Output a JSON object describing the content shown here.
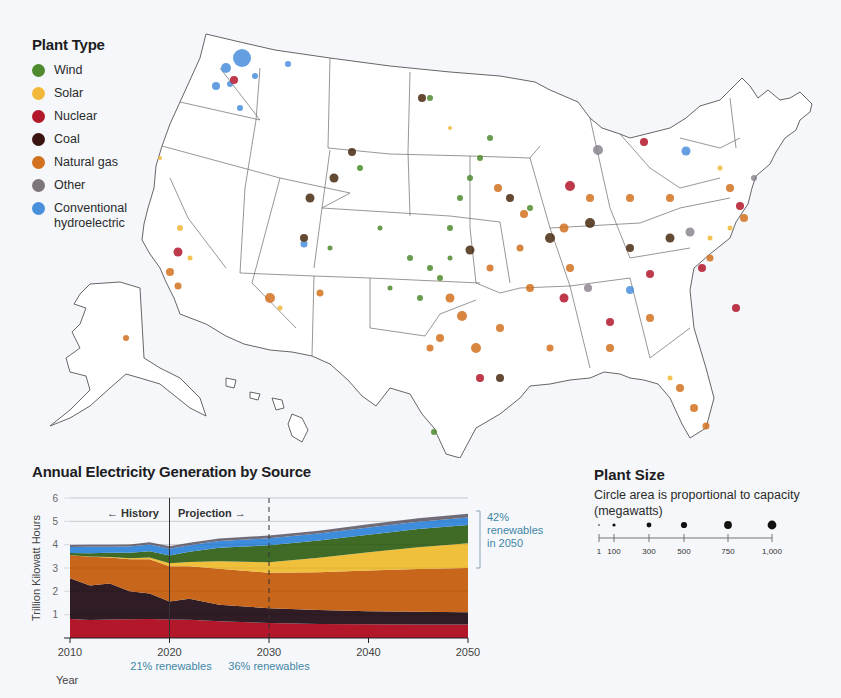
{
  "legend_type": {
    "title": "Plant Type",
    "items": [
      {
        "label": "Wind",
        "color": "#4f8a2e"
      },
      {
        "label": "Solar",
        "color": "#f2b83a"
      },
      {
        "label": "Nuclear",
        "color": "#b3172a"
      },
      {
        "label": "Coal",
        "color": "#3a1410"
      },
      {
        "label": "Natural gas",
        "color": "#d2711f"
      },
      {
        "label": "Other",
        "color": "#7d757c"
      },
      {
        "label": "Conventional hydroelectric",
        "label_line1": "Conventional",
        "label_line2": "hydroelectric",
        "color": "#4a8fdc"
      }
    ]
  },
  "map": {
    "description": "Power plants of the United States (contiguous US, Alaska, Hawaii); circle color = plant type, circle area = capacity"
  },
  "legend_size": {
    "title": "Plant Size",
    "subtitle_line1": "Circle area is proportional to capacity",
    "subtitle_line2": "(megawatts)",
    "ticks": [
      "1",
      "100",
      "300",
      "500",
      "750",
      "1,000"
    ]
  },
  "chart_data": {
    "type": "area",
    "stacked": true,
    "title": "Annual Electricity Generation by Source",
    "xlabel": "Year",
    "ylabel": "Trillion Kilowatt Hours",
    "ylim": [
      0,
      6
    ],
    "yticks": [
      1,
      2,
      3,
      4,
      5,
      6
    ],
    "xticks": [
      2010,
      2020,
      2030,
      2040,
      2050
    ],
    "grid": true,
    "x": [
      2010,
      2012,
      2014,
      2016,
      2018,
      2020,
      2022,
      2025,
      2030,
      2035,
      2040,
      2045,
      2050
    ],
    "series": [
      {
        "name": "Nuclear",
        "color": "#b3172a",
        "values": [
          0.81,
          0.77,
          0.79,
          0.8,
          0.81,
          0.79,
          0.78,
          0.72,
          0.64,
          0.6,
          0.59,
          0.58,
          0.58
        ]
      },
      {
        "name": "Coal",
        "color": "#2f1c24",
        "values": [
          1.75,
          1.48,
          1.55,
          1.2,
          1.1,
          0.77,
          0.9,
          0.7,
          0.64,
          0.6,
          0.56,
          0.54,
          0.52
        ]
      },
      {
        "name": "Natural gas",
        "color": "#c8661c",
        "values": [
          0.99,
          1.23,
          1.11,
          1.38,
          1.47,
          1.52,
          1.4,
          1.55,
          1.52,
          1.62,
          1.74,
          1.84,
          1.9
        ]
      },
      {
        "name": "Solar",
        "color": "#f0bf3c",
        "values": [
          0.0,
          0.01,
          0.02,
          0.04,
          0.07,
          0.12,
          0.18,
          0.32,
          0.45,
          0.62,
          0.78,
          0.93,
          1.06
        ]
      },
      {
        "name": "Wind",
        "color": "#3f6b26",
        "values": [
          0.09,
          0.14,
          0.18,
          0.23,
          0.27,
          0.34,
          0.44,
          0.58,
          0.72,
          0.74,
          0.76,
          0.78,
          0.78
        ]
      },
      {
        "name": "Conventional hydroelectric",
        "color": "#3d8ddc",
        "values": [
          0.26,
          0.28,
          0.26,
          0.27,
          0.29,
          0.29,
          0.28,
          0.29,
          0.3,
          0.3,
          0.31,
          0.31,
          0.32
        ]
      },
      {
        "name": "Other",
        "color": "#706b78",
        "values": [
          0.09,
          0.09,
          0.09,
          0.09,
          0.09,
          0.1,
          0.1,
          0.1,
          0.12,
          0.12,
          0.13,
          0.15,
          0.17
        ]
      }
    ],
    "annotations": [
      {
        "text": "← History",
        "x": 2015
      },
      {
        "text": "Projection →",
        "x": 2024
      },
      {
        "text": "21% renewables",
        "x": 2020
      },
      {
        "text": "36% renewables",
        "x": 2030
      },
      {
        "text_line1": "42%",
        "text_line2": "renewables",
        "text_line3": "in 2050",
        "x": 2050
      }
    ],
    "vertical_lines": [
      {
        "x": 2020,
        "style": "solid"
      },
      {
        "x": 2030,
        "style": "dashed"
      }
    ]
  }
}
